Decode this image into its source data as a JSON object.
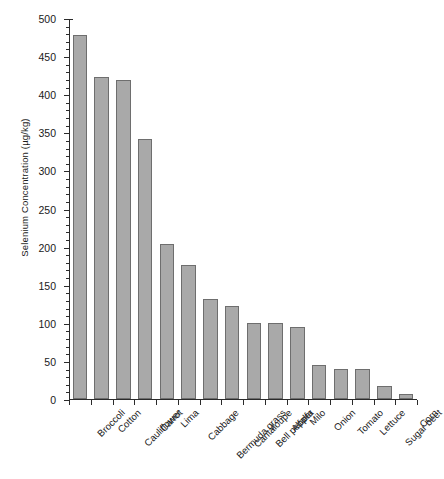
{
  "chart_data": {
    "type": "bar",
    "title": "",
    "xlabel": "",
    "ylabel": "Selenium Concentration (µg/kg)",
    "ylim": [
      0,
      500
    ],
    "ytick_step": 50,
    "yminor_step": 10,
    "grid": false,
    "legend": null,
    "categories": [
      "Broccoli",
      "Cotton",
      "Cauliflower",
      "Carrot",
      "Lima",
      "Cabbage",
      "Bermuda grass",
      "Cantaloupe",
      "Bell pepper",
      "Alfalfa",
      "Milo",
      "Onion",
      "Tomato",
      "Lettuce",
      "Sugar beet",
      "Corn"
    ],
    "values": [
      478,
      422,
      418,
      341,
      203,
      176,
      131,
      122,
      100,
      100,
      94,
      45,
      40,
      39,
      17,
      7
    ],
    "ytick_labels": [
      "0",
      "50",
      "100",
      "150",
      "200",
      "250",
      "300",
      "350",
      "400",
      "450",
      "500"
    ],
    "bar_fill_color": "#a9a9a9",
    "bar_edge_color": "#6e6e6e",
    "axis_color": "#2b2b2b"
  },
  "caption": {
    "top_strip": ""
  }
}
